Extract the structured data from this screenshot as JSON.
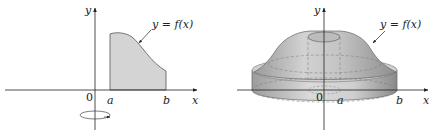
{
  "left_figure": {
    "y_axis_label": "y",
    "x_axis_label": "x",
    "origin_label": "0",
    "a_label": "a",
    "b_label": "b",
    "curve_label": "y = f(x)",
    "region_fill": "#d4d4d4",
    "rotation_indicator": "rotation-about-y-axis"
  },
  "right_figure": {
    "y_axis_label": "y",
    "x_axis_label": "x",
    "origin_label": "0",
    "a_label": "a",
    "b_label": "b",
    "curve_label": "y = f(x)",
    "solid_fill": "#c8c8c8"
  }
}
